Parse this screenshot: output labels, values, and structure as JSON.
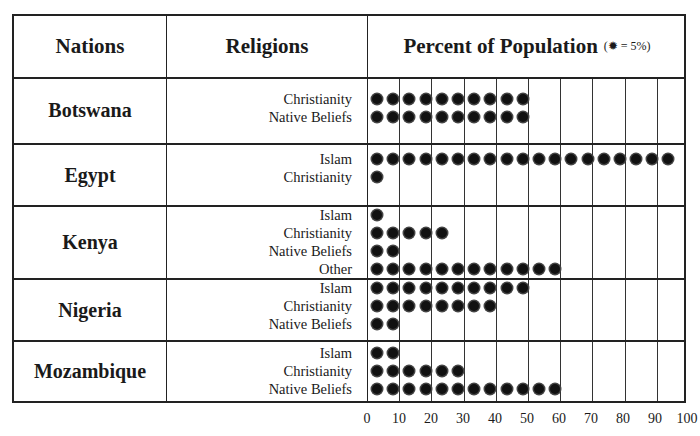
{
  "header": {
    "nations_label": "Nations",
    "religions_label": "Religions",
    "percent_label": "Percent of Population",
    "legend_note": "(✹ = 5%)"
  },
  "nations": [
    {
      "name": "Botswana",
      "religions": [
        {
          "label": "Christianity",
          "dots": 10
        },
        {
          "label": "Native Beliefs",
          "dots": 10
        }
      ]
    },
    {
      "name": "Egypt",
      "religions": [
        {
          "label": "Islam",
          "dots": 19
        },
        {
          "label": "Christianity",
          "dots": 1
        }
      ]
    },
    {
      "name": "Kenya",
      "religions": [
        {
          "label": "Islam",
          "dots": 1
        },
        {
          "label": "Christianity",
          "dots": 5
        },
        {
          "label": "Native Beliefs",
          "dots": 2
        },
        {
          "label": "Other",
          "dots": 12
        }
      ]
    },
    {
      "name": "Nigeria",
      "religions": [
        {
          "label": "Islam",
          "dots": 10
        },
        {
          "label": "Christianity",
          "dots": 8
        },
        {
          "label": "Native Beliefs",
          "dots": 2
        }
      ]
    },
    {
      "name": "Mozambique",
      "religions": [
        {
          "label": "Islam",
          "dots": 2
        },
        {
          "label": "Christianity",
          "dots": 6
        },
        {
          "label": "Native Beliefs",
          "dots": 12
        }
      ]
    }
  ],
  "x_ticks": [
    "0",
    "10",
    "20",
    "30",
    "40",
    "50",
    "60",
    "70",
    "80",
    "90",
    "100"
  ],
  "chart_data": {
    "type": "pictograph",
    "title": "Percent of Population",
    "legend": "one symbol = 5%",
    "xlabel": "Percent of Population",
    "ylabel": "Nations / Religions",
    "xlim": [
      0,
      100
    ],
    "x_ticks": [
      0,
      10,
      20,
      30,
      40,
      50,
      60,
      70,
      80,
      90,
      100
    ],
    "grid": true,
    "categories": [
      "Botswana - Christianity",
      "Botswana - Native Beliefs",
      "Egypt - Islam",
      "Egypt - Christianity",
      "Kenya - Islam",
      "Kenya - Christianity",
      "Kenya - Native Beliefs",
      "Kenya - Other",
      "Nigeria - Islam",
      "Nigeria - Christianity",
      "Nigeria - Native Beliefs",
      "Mozambique - Islam",
      "Mozambique - Christianity",
      "Mozambique - Native Beliefs"
    ],
    "values": [
      50,
      50,
      95,
      5,
      5,
      25,
      10,
      60,
      50,
      40,
      10,
      10,
      30,
      60
    ]
  }
}
